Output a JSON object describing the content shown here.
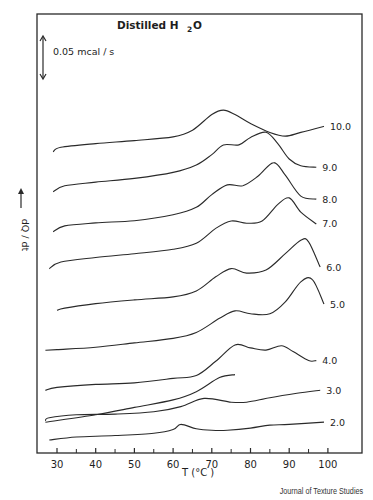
{
  "chart_data": {
    "type": "line",
    "title_main": "Distilled H",
    "title_sub": "2",
    "title_tail": "O",
    "scale_bar_label": "0.05 mcal / s",
    "xlabel": "T (°C )",
    "ylabel": "dQ / dt",
    "xlim": [
      25,
      105
    ],
    "x_ticks": [
      30,
      40,
      50,
      60,
      70,
      80,
      90,
      100
    ],
    "x_minor_ticks": [
      35,
      45,
      55,
      65,
      75,
      85,
      95
    ],
    "grid": false,
    "legend": "curve labels at right end",
    "y_units": "relative heat flow (curves vertically offset)",
    "series": [
      {
        "name": "10.0",
        "label": "10.0",
        "offset": 9.0,
        "points": [
          [
            29,
            0.0
          ],
          [
            31,
            0.6
          ],
          [
            40,
            1.1
          ],
          [
            50,
            1.5
          ],
          [
            60,
            2.0
          ],
          [
            65,
            2.9
          ],
          [
            70,
            5.0
          ],
          [
            73,
            5.6
          ],
          [
            76,
            5.0
          ],
          [
            80,
            3.8
          ],
          [
            85,
            2.6
          ],
          [
            89,
            2.1
          ],
          [
            93,
            2.6
          ],
          [
            99,
            3.4
          ]
        ]
      },
      {
        "name": "9.0",
        "label": "9.0",
        "offset": 7.75,
        "points": [
          [
            29,
            0.0
          ],
          [
            32,
            0.8
          ],
          [
            40,
            1.3
          ],
          [
            50,
            1.8
          ],
          [
            60,
            2.6
          ],
          [
            66,
            3.6
          ],
          [
            70,
            5.0
          ],
          [
            73,
            6.3
          ],
          [
            77,
            6.3
          ],
          [
            80,
            7.3
          ],
          [
            84,
            8.0
          ],
          [
            87,
            6.5
          ],
          [
            90,
            4.4
          ],
          [
            93,
            3.5
          ],
          [
            97,
            3.3
          ]
        ]
      },
      {
        "name": "8.0",
        "label": "8.0",
        "offset": 6.5,
        "points": [
          [
            29,
            0.0
          ],
          [
            32,
            0.8
          ],
          [
            40,
            1.2
          ],
          [
            50,
            1.5
          ],
          [
            60,
            2.3
          ],
          [
            66,
            3.3
          ],
          [
            70,
            5.0
          ],
          [
            74,
            6.3
          ],
          [
            78,
            6.2
          ],
          [
            82,
            7.5
          ],
          [
            86,
            9.3
          ],
          [
            89,
            7.6
          ],
          [
            93,
            4.8
          ],
          [
            97,
            4.4
          ]
        ]
      },
      {
        "name": "7.0",
        "label": "7.0",
        "offset": 5.35,
        "points": [
          [
            28,
            0.0
          ],
          [
            31,
            0.9
          ],
          [
            40,
            1.5
          ],
          [
            50,
            2.0
          ],
          [
            60,
            2.6
          ],
          [
            66,
            3.4
          ],
          [
            71,
            5.4
          ],
          [
            75,
            6.4
          ],
          [
            79,
            6.1
          ],
          [
            83,
            6.4
          ],
          [
            87,
            8.6
          ],
          [
            90,
            9.5
          ],
          [
            93,
            7.6
          ],
          [
            97,
            6.0
          ]
        ]
      },
      {
        "name": "6.0",
        "label": "6.0",
        "offset": 4.05,
        "points": [
          [
            30,
            0.0
          ],
          [
            32,
            0.3
          ],
          [
            40,
            0.9
          ],
          [
            50,
            1.4
          ],
          [
            60,
            1.8
          ],
          [
            66,
            2.6
          ],
          [
            71,
            4.5
          ],
          [
            75,
            5.6
          ],
          [
            79,
            5.0
          ],
          [
            84,
            5.4
          ],
          [
            89,
            7.6
          ],
          [
            93,
            9.4
          ],
          [
            95,
            9.2
          ],
          [
            98,
            5.8
          ]
        ]
      },
      {
        "name": "5.0",
        "label": "5.0",
        "offset": 2.8,
        "points": [
          [
            27,
            0.0
          ],
          [
            30,
            0.1
          ],
          [
            40,
            0.4
          ],
          [
            50,
            1.0
          ],
          [
            60,
            1.6
          ],
          [
            66,
            2.4
          ],
          [
            72,
            4.3
          ],
          [
            76,
            5.3
          ],
          [
            80,
            4.9
          ],
          [
            85,
            4.9
          ],
          [
            89,
            6.5
          ],
          [
            93,
            9.2
          ],
          [
            96,
            9.5
          ],
          [
            99,
            6.2
          ]
        ]
      },
      {
        "name": "4.0",
        "label": "4.0",
        "offset": 1.55,
        "points": [
          [
            27,
            0.0
          ],
          [
            30,
            0.4
          ],
          [
            40,
            0.8
          ],
          [
            50,
            1.0
          ],
          [
            60,
            1.6
          ],
          [
            66,
            2.0
          ],
          [
            71,
            3.9
          ],
          [
            76,
            6.1
          ],
          [
            80,
            5.7
          ],
          [
            84,
            5.4
          ],
          [
            88,
            6.0
          ],
          [
            91,
            5.2
          ],
          [
            95,
            4.0
          ],
          [
            97,
            4.0
          ]
        ]
      },
      {
        "name": "3.0",
        "label": "3.0",
        "offset": 0.6,
        "points": [
          [
            27,
            0.0
          ],
          [
            28,
            0.4
          ],
          [
            35,
            0.8
          ],
          [
            45,
            0.9
          ],
          [
            55,
            1.2
          ],
          [
            62,
            1.9
          ],
          [
            68,
            3.0
          ],
          [
            75,
            2.5
          ],
          [
            79,
            2.5
          ],
          [
            85,
            3.1
          ],
          [
            92,
            3.7
          ],
          [
            98,
            4.1
          ]
        ]
      },
      {
        "name": "2.0",
        "label": "2.0",
        "offset": 0.0,
        "points": [
          [
            28,
            0.0
          ],
          [
            35,
            0.4
          ],
          [
            45,
            0.6
          ],
          [
            55,
            0.9
          ],
          [
            60,
            1.4
          ],
          [
            62,
            2.1
          ],
          [
            66,
            1.5
          ],
          [
            70,
            1.3
          ],
          [
            74,
            1.3
          ],
          [
            80,
            1.6
          ],
          [
            85,
            2.0
          ],
          [
            90,
            2.1
          ],
          [
            99,
            2.4
          ]
        ]
      }
    ],
    "extra_curve_note": "Curve beneath 3.0 rising steeply from 30 °C through ~68 °C into 4.0 region",
    "extra_curve": {
      "name": "3.0-lower-branch",
      "points": [
        [
          27,
          -0.2
        ],
        [
          40,
          0.8
        ],
        [
          50,
          1.8
        ],
        [
          60,
          2.8
        ],
        [
          66,
          3.9
        ],
        [
          72,
          5.8
        ],
        [
          76,
          6.2
        ]
      ]
    }
  },
  "credit": "Journal of Texture Studies"
}
